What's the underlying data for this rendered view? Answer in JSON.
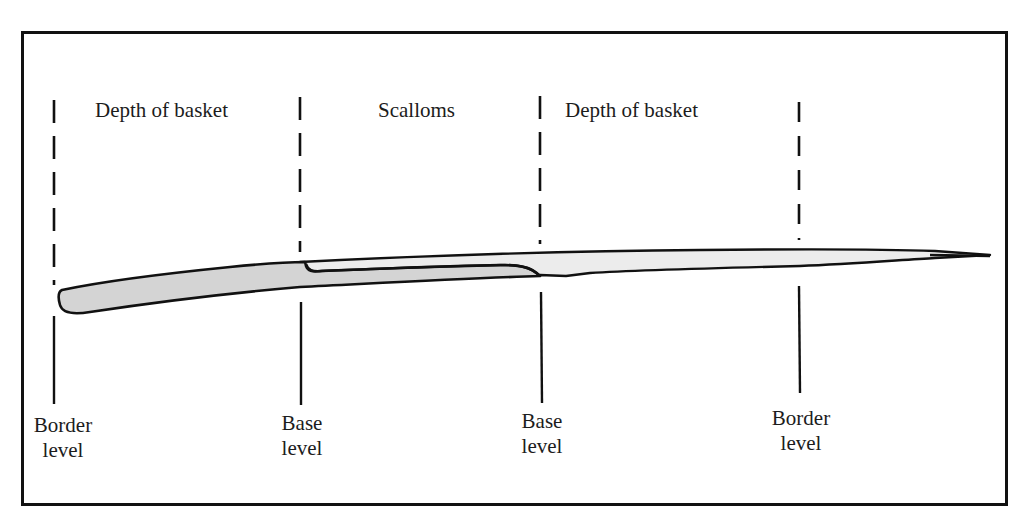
{
  "diagram": {
    "top_labels": [
      {
        "text": "Depth of basket"
      },
      {
        "text": "Scalloms"
      },
      {
        "text": "Depth of basket"
      }
    ],
    "bottom_labels": [
      {
        "line1": "Border",
        "line2": "level"
      },
      {
        "line1": "Base",
        "line2": "level"
      },
      {
        "line1": "Base",
        "line2": "level"
      },
      {
        "line1": "Border",
        "line2": "level"
      }
    ],
    "colors": {
      "stroke": "#111111",
      "rod_shaded_fill": "#d4d4d4",
      "rod_light_fill": "#ececec",
      "background": "#ffffff"
    },
    "markers": [
      {
        "name": "border-level-left",
        "x": 54
      },
      {
        "name": "base-level-left",
        "x": 300
      },
      {
        "name": "base-level-right",
        "x": 540
      },
      {
        "name": "border-level-right",
        "x": 799
      }
    ]
  }
}
